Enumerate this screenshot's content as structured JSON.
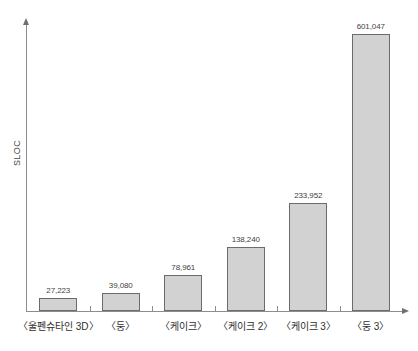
{
  "chart_data": {
    "type": "bar",
    "title": "",
    "xlabel": "",
    "ylabel": "SLOC",
    "categories": [
      "〈울펜슈타인 3D〉",
      "〈둥〉",
      "〈케이크〉",
      "〈케이크 2〉",
      "〈케이크 3〉",
      "〈둥 3〉"
    ],
    "values": [
      27223,
      39080,
      78961,
      138240,
      233952,
      601047
    ],
    "value_labels": [
      "27,223",
      "39,080",
      "78,961",
      "138,240",
      "233,952",
      "601,047"
    ],
    "ylim": [
      0,
      640000
    ],
    "grid": false,
    "legend": false,
    "axis_arrows": true,
    "bar_fill": "#d2d2d2",
    "bar_border": "#6b6b6b",
    "axis_color": "#8d8d8d"
  }
}
